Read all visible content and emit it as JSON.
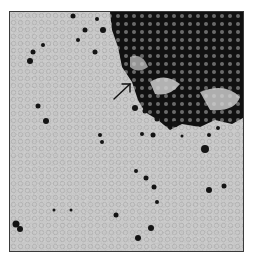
{
  "figure": {
    "kind": "micrograph",
    "annotation": {
      "type": "arrow",
      "direction": "up-right",
      "from": [
        113,
        98
      ],
      "to": [
        129,
        83
      ],
      "color": "#111111"
    },
    "colors": {
      "background": "#c9c9c9",
      "stained_cells": "#141414",
      "frame_border": "#3a3a3a",
      "page": "#ffffff"
    }
  }
}
